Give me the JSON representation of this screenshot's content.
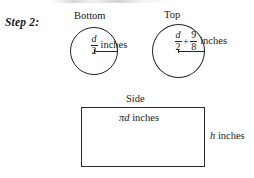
{
  "step": {
    "label": "Step 2:"
  },
  "figures": {
    "bottom": {
      "caption": "Bottom",
      "measure": {
        "numerator": "d",
        "denominator": "2",
        "unit": "inches"
      }
    },
    "top": {
      "caption": "Top",
      "measure": {
        "term1": {
          "numerator": "d",
          "denominator": "2"
        },
        "operator": "+",
        "term2": {
          "numerator": "9",
          "denominator": "8"
        },
        "unit": "inches"
      }
    },
    "side": {
      "caption": "Side",
      "width_label_variable": "πd",
      "width_label_unit": " inches",
      "height_label_variable": "h",
      "height_label_unit": " inches"
    }
  },
  "colors": {
    "ink": "#222222",
    "background": "#ffffff"
  }
}
